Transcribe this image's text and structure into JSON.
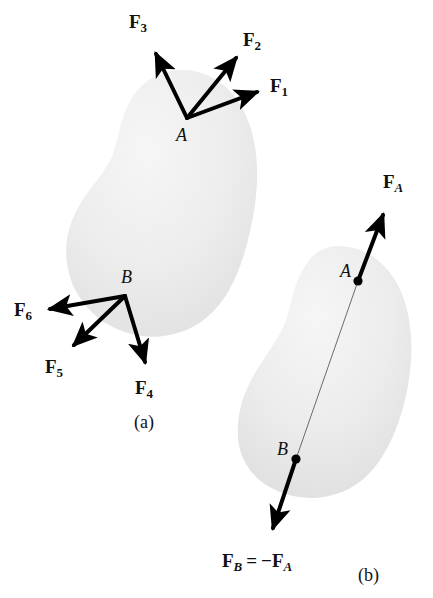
{
  "figure": {
    "background_color": "#ffffff",
    "body_fill_color": "#ededed",
    "vector_color": "#000000",
    "panels": [
      {
        "id": "a",
        "caption": "(a)",
        "caption_pos": {
          "x": 134,
          "y": 413
        },
        "description": "Rigid body with six forces applied at two points",
        "body": {
          "name": "rigid-body-a",
          "bbox": {
            "x": 66,
            "y": 68,
            "w": 190,
            "h": 266
          }
        },
        "points": [
          {
            "label": "A",
            "x": 187,
            "y": 118,
            "label_pos": {
              "x": 176,
              "y": 126
            },
            "dot": false
          },
          {
            "label": "B",
            "x": 125,
            "y": 296,
            "label_pos": {
              "x": 121,
              "y": 268
            },
            "dot": false
          }
        ],
        "forces": [
          {
            "name": "F1",
            "base": "F",
            "sub": "1",
            "tail": {
              "x": 187,
              "y": 118
            },
            "tip": {
              "x": 264,
              "y": 90
            },
            "label_pos": {
              "x": 270,
              "y": 76
            }
          },
          {
            "name": "F2",
            "base": "F",
            "sub": "2",
            "tail": {
              "x": 187,
              "y": 118
            },
            "tip": {
              "x": 241,
              "y": 52
            },
            "label_pos": {
              "x": 243,
              "y": 30
            }
          },
          {
            "name": "F3",
            "base": "F",
            "sub": "3",
            "tail": {
              "x": 187,
              "y": 118
            },
            "tip": {
              "x": 152,
              "y": 46
            },
            "label_pos": {
              "x": 129,
              "y": 12
            }
          },
          {
            "name": "F4",
            "base": "F",
            "sub": "4",
            "tail": {
              "x": 125,
              "y": 296
            },
            "tip": {
              "x": 147,
              "y": 370
            },
            "label_pos": {
              "x": 135,
              "y": 378
            }
          },
          {
            "name": "F5",
            "base": "F",
            "sub": "5",
            "tail": {
              "x": 125,
              "y": 296
            },
            "tip": {
              "x": 68,
              "y": 350
            },
            "label_pos": {
              "x": 45,
              "y": 357
            }
          },
          {
            "name": "F6",
            "base": "F",
            "sub": "6",
            "tail": {
              "x": 125,
              "y": 296
            },
            "tip": {
              "x": 42,
              "y": 310
            },
            "label_pos": {
              "x": 14,
              "y": 300
            }
          }
        ]
      },
      {
        "id": "b",
        "caption": "(b)",
        "caption_pos": {
          "x": 358,
          "y": 566
        },
        "description": "Same rigid body with equal and opposite forces along a common line of action",
        "body": {
          "name": "rigid-body-b",
          "bbox": {
            "x": 240,
            "y": 245,
            "w": 172,
            "h": 252
          }
        },
        "points": [
          {
            "label": "A",
            "x": 358,
            "y": 281,
            "label_pos": {
              "x": 340,
              "y": 262
            },
            "dot": true
          },
          {
            "label": "B",
            "x": 296,
            "y": 459,
            "label_pos": {
              "x": 277,
              "y": 440
            },
            "dot": true
          }
        ],
        "action_line": {
          "name": "line-of-action",
          "x1": 358,
          "y1": 281,
          "x2": 296,
          "y2": 459
        },
        "forces": [
          {
            "name": "FA",
            "base": "F",
            "sub_italic": "A",
            "tail": {
              "x": 358,
              "y": 281
            },
            "tip": {
              "x": 386,
              "y": 207
            },
            "label_pos": {
              "x": 383,
              "y": 172
            }
          },
          {
            "name": "FB",
            "base": "F",
            "sub_italic": "B",
            "tail": {
              "x": 296,
              "y": 459
            },
            "tip": {
              "x": 269,
              "y": 537
            },
            "label_pos": {
              "x": 222,
              "y": 551
            },
            "label_text": "F_B = -F_A"
          }
        ]
      }
    ]
  },
  "labels": {
    "f1": {
      "base": "F",
      "sub": "1"
    },
    "f2": {
      "base": "F",
      "sub": "2"
    },
    "f3": {
      "base": "F",
      "sub": "3"
    },
    "f4": {
      "base": "F",
      "sub": "4"
    },
    "f5": {
      "base": "F",
      "sub": "5"
    },
    "f6": {
      "base": "F",
      "sub": "6"
    },
    "fa": {
      "base": "F",
      "sub": "A"
    },
    "fb": {
      "base": "F",
      "sub": "B"
    },
    "point_a_top": "A",
    "point_b_bottom": "B",
    "point_a_panel_b": "A",
    "point_b_panel_b": "B",
    "caption_a": "(a)",
    "caption_b": "(b)",
    "equals": "=",
    "minus": "−"
  }
}
